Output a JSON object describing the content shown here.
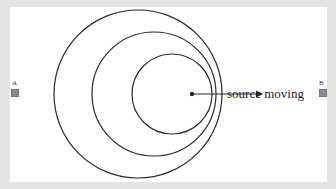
{
  "diagram": {
    "label": "source moving",
    "markers": [
      {
        "id": "A",
        "label": "A",
        "x": 12,
        "y": 90
      },
      {
        "id": "B",
        "label": "B",
        "x": 320,
        "y": 90
      }
    ],
    "wavefronts": [
      {
        "cx": 138,
        "cy": 94,
        "r": 84
      },
      {
        "cx": 154,
        "cy": 94,
        "r": 62
      },
      {
        "cx": 172,
        "cy": 94,
        "r": 40
      }
    ],
    "source": {
      "x": 192,
      "y": 94
    },
    "arrow": {
      "x1": 192,
      "y1": 94,
      "x2": 262,
      "y2": 94
    },
    "colors": {
      "stroke": "#2a2a2a",
      "background": "#e4e4e4",
      "panel": "#ffffff",
      "marker": "#8a8a8a"
    }
  }
}
